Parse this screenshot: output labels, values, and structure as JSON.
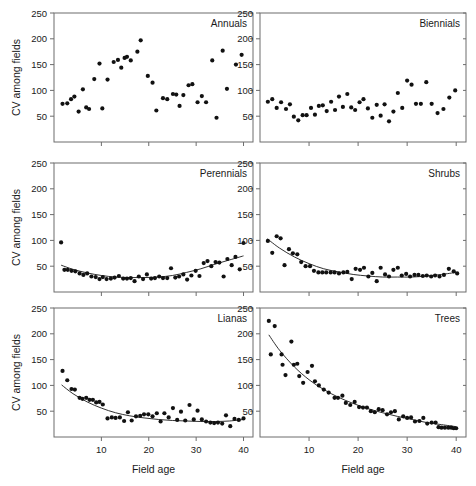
{
  "figure": {
    "axis_labels": {
      "y": "CV among fields",
      "x": "Field age"
    },
    "y_ticks": [
      "250",
      "200",
      "150",
      "100",
      "50"
    ],
    "y_tick_values": [
      250,
      200,
      150,
      100,
      50
    ],
    "x_ticks": [
      "10",
      "20",
      "30",
      "40"
    ],
    "x_tick_values": [
      10,
      20,
      30,
      40
    ],
    "ylim": [
      0,
      250
    ],
    "xlim": [
      0,
      42
    ],
    "marker_color": "#111111",
    "curve_color": "#1a1a1a",
    "axis_color": "#6d6d6d"
  },
  "chart_data": [
    {
      "type": "scatter",
      "title": "Annuals",
      "xlabel": "Field age",
      "ylabel": "CV among fields",
      "xlim": [
        0,
        42
      ],
      "ylim": [
        0,
        250
      ],
      "grid": false,
      "legend": "none",
      "has_fit_curve": false,
      "points": [
        [
          1.8,
          74
        ],
        [
          2.8,
          75
        ],
        [
          3.6,
          83
        ],
        [
          4.3,
          88
        ],
        [
          5.2,
          59
        ],
        [
          6.1,
          102
        ],
        [
          6.8,
          67
        ],
        [
          7.4,
          64
        ],
        [
          8.5,
          122
        ],
        [
          9.6,
          152
        ],
        [
          10.2,
          65
        ],
        [
          11.3,
          121
        ],
        [
          12.6,
          155
        ],
        [
          13.5,
          159
        ],
        [
          14.2,
          144
        ],
        [
          14.9,
          163
        ],
        [
          15.4,
          165
        ],
        [
          16.2,
          158
        ],
        [
          17.6,
          175
        ],
        [
          18.3,
          197
        ],
        [
          19.8,
          128
        ],
        [
          20.8,
          115
        ],
        [
          21.6,
          61
        ],
        [
          23.0,
          85
        ],
        [
          23.9,
          83
        ],
        [
          25.1,
          93
        ],
        [
          25.8,
          92
        ],
        [
          26.5,
          70
        ],
        [
          27.3,
          91
        ],
        [
          28.4,
          110
        ],
        [
          29.2,
          112
        ],
        [
          30.3,
          77
        ],
        [
          31.2,
          89
        ],
        [
          32.1,
          77
        ],
        [
          33.4,
          158
        ],
        [
          34.3,
          47
        ],
        [
          35.6,
          177
        ],
        [
          36.5,
          103
        ],
        [
          38.4,
          150
        ],
        [
          39.6,
          169
        ]
      ]
    },
    {
      "type": "scatter",
      "title": "Biennials",
      "xlabel": "Field age",
      "ylabel": "CV among fields",
      "xlim": [
        0,
        42
      ],
      "ylim": [
        0,
        250
      ],
      "grid": false,
      "legend": "none",
      "has_fit_curve": false,
      "points": [
        [
          1.6,
          78
        ],
        [
          2.5,
          83
        ],
        [
          3.4,
          66
        ],
        [
          4.3,
          77
        ],
        [
          5.3,
          64
        ],
        [
          6.1,
          73
        ],
        [
          6.9,
          49
        ],
        [
          7.8,
          42
        ],
        [
          8.7,
          52
        ],
        [
          9.5,
          52
        ],
        [
          10.4,
          66
        ],
        [
          11.2,
          53
        ],
        [
          12.0,
          70
        ],
        [
          12.8,
          71
        ],
        [
          13.6,
          60
        ],
        [
          14.5,
          78
        ],
        [
          15.3,
          62
        ],
        [
          16.1,
          88
        ],
        [
          16.9,
          68
        ],
        [
          17.8,
          93
        ],
        [
          18.6,
          67
        ],
        [
          19.4,
          62
        ],
        [
          20.3,
          77
        ],
        [
          21.1,
          83
        ],
        [
          22.0,
          65
        ],
        [
          22.9,
          47
        ],
        [
          23.8,
          72
        ],
        [
          24.6,
          51
        ],
        [
          25.4,
          73
        ],
        [
          26.3,
          40
        ],
        [
          27.2,
          59
        ],
        [
          28.1,
          95
        ],
        [
          29.0,
          66
        ],
        [
          30.0,
          119
        ],
        [
          30.9,
          111
        ],
        [
          31.8,
          74
        ],
        [
          32.8,
          74
        ],
        [
          33.9,
          116
        ],
        [
          35.0,
          74
        ],
        [
          36.2,
          56
        ],
        [
          37.4,
          64
        ],
        [
          38.6,
          86
        ],
        [
          39.8,
          100
        ]
      ]
    },
    {
      "type": "scatter",
      "title": "Perennials",
      "xlabel": "Field age",
      "ylabel": "CV among fields",
      "xlim": [
        0,
        42
      ],
      "ylim": [
        0,
        250
      ],
      "grid": false,
      "legend": "none",
      "has_fit_curve": true,
      "fit_curve_shape": "u-shaped-quadratic",
      "fit_curve": [
        [
          1.5,
          52
        ],
        [
          4,
          44
        ],
        [
          7,
          37
        ],
        [
          10,
          32
        ],
        [
          13,
          29
        ],
        [
          16,
          28
        ],
        [
          19,
          28
        ],
        [
          22,
          29
        ],
        [
          25,
          32
        ],
        [
          28,
          38
        ],
        [
          31,
          45
        ],
        [
          34,
          54
        ],
        [
          37,
          62
        ],
        [
          40,
          70
        ]
      ],
      "points": [
        [
          1.5,
          96
        ],
        [
          2.2,
          43
        ],
        [
          2.9,
          43
        ],
        [
          3.7,
          41
        ],
        [
          4.5,
          40
        ],
        [
          5.4,
          36
        ],
        [
          6.2,
          33
        ],
        [
          7.0,
          36
        ],
        [
          7.9,
          30
        ],
        [
          8.8,
          29
        ],
        [
          9.6,
          25
        ],
        [
          10.3,
          29
        ],
        [
          11.1,
          25
        ],
        [
          12.0,
          26
        ],
        [
          12.8,
          28
        ],
        [
          13.7,
          31
        ],
        [
          14.6,
          26
        ],
        [
          15.4,
          26
        ],
        [
          16.2,
          27
        ],
        [
          17.0,
          21
        ],
        [
          17.9,
          30
        ],
        [
          18.8,
          25
        ],
        [
          19.6,
          34
        ],
        [
          20.5,
          26
        ],
        [
          21.3,
          27
        ],
        [
          22.2,
          30
        ],
        [
          23.0,
          27
        ],
        [
          23.9,
          27
        ],
        [
          24.7,
          46
        ],
        [
          25.6,
          28
        ],
        [
          26.4,
          30
        ],
        [
          27.3,
          34
        ],
        [
          28.1,
          24
        ],
        [
          29.0,
          32
        ],
        [
          29.9,
          41
        ],
        [
          30.7,
          31
        ],
        [
          31.6,
          56
        ],
        [
          32.4,
          60
        ],
        [
          33.2,
          50
        ],
        [
          34.1,
          58
        ],
        [
          34.9,
          57
        ],
        [
          35.8,
          30
        ],
        [
          36.6,
          64
        ],
        [
          37.5,
          52
        ],
        [
          38.3,
          68
        ],
        [
          39.2,
          44
        ],
        [
          40.0,
          95
        ]
      ]
    },
    {
      "type": "scatter",
      "title": "Shrubs",
      "xlabel": "Field age",
      "ylabel": "CV among fields",
      "xlim": [
        0,
        42
      ],
      "ylim": [
        0,
        250
      ],
      "grid": false,
      "legend": "none",
      "has_fit_curve": true,
      "fit_curve_shape": "decaying-then-flat",
      "fit_curve": [
        [
          1.5,
          103
        ],
        [
          4,
          85
        ],
        [
          7,
          68
        ],
        [
          10,
          55
        ],
        [
          13,
          45
        ],
        [
          16,
          39
        ],
        [
          19,
          34
        ],
        [
          22,
          31
        ],
        [
          25,
          29
        ],
        [
          28,
          29
        ],
        [
          31,
          29
        ],
        [
          34,
          31
        ],
        [
          37,
          34
        ],
        [
          40,
          38
        ]
      ],
      "points": [
        [
          1.6,
          99
        ],
        [
          2.5,
          76
        ],
        [
          3.4,
          108
        ],
        [
          4.2,
          104
        ],
        [
          5.0,
          52
        ],
        [
          5.9,
          83
        ],
        [
          6.7,
          75
        ],
        [
          7.6,
          73
        ],
        [
          8.4,
          58
        ],
        [
          9.3,
          50
        ],
        [
          10.2,
          50
        ],
        [
          11.0,
          41
        ],
        [
          11.9,
          38
        ],
        [
          12.7,
          38
        ],
        [
          13.5,
          38
        ],
        [
          14.4,
          38
        ],
        [
          15.2,
          38
        ],
        [
          16.1,
          36
        ],
        [
          17.0,
          38
        ],
        [
          17.8,
          39
        ],
        [
          18.7,
          25
        ],
        [
          19.5,
          45
        ],
        [
          20.4,
          43
        ],
        [
          21.2,
          47
        ],
        [
          22.1,
          30
        ],
        [
          22.9,
          37
        ],
        [
          23.8,
          21
        ],
        [
          24.6,
          47
        ],
        [
          25.5,
          34
        ],
        [
          26.3,
          30
        ],
        [
          27.2,
          43
        ],
        [
          28.1,
          47
        ],
        [
          28.9,
          32
        ],
        [
          29.8,
          35
        ],
        [
          30.6,
          30
        ],
        [
          31.5,
          33
        ],
        [
          32.3,
          33
        ],
        [
          33.2,
          31
        ],
        [
          34.0,
          32
        ],
        [
          34.9,
          30
        ],
        [
          35.7,
          32
        ],
        [
          36.6,
          30
        ],
        [
          37.5,
          33
        ],
        [
          38.5,
          45
        ],
        [
          39.5,
          40
        ],
        [
          40.2,
          36
        ]
      ]
    },
    {
      "type": "scatter",
      "title": "Lianas",
      "xlabel": "Field age",
      "ylabel": "CV among fields",
      "xlim": [
        0,
        42
      ],
      "ylim": [
        0,
        250
      ],
      "grid": false,
      "legend": "none",
      "has_fit_curve": true,
      "fit_curve_shape": "decaying-then-flat",
      "fit_curve": [
        [
          1.6,
          101
        ],
        [
          4,
          84
        ],
        [
          7,
          68
        ],
        [
          10,
          56
        ],
        [
          13,
          47
        ],
        [
          16,
          41
        ],
        [
          19,
          37
        ],
        [
          22,
          34
        ],
        [
          25,
          32
        ],
        [
          28,
          31
        ],
        [
          31,
          30
        ],
        [
          34,
          30
        ],
        [
          37,
          31
        ],
        [
          40,
          34
        ]
      ],
      "points": [
        [
          1.8,
          128
        ],
        [
          2.8,
          110
        ],
        [
          3.7,
          93
        ],
        [
          4.4,
          92
        ],
        [
          5.4,
          76
        ],
        [
          6.0,
          74
        ],
        [
          6.8,
          76
        ],
        [
          7.5,
          72
        ],
        [
          8.2,
          72
        ],
        [
          8.9,
          67
        ],
        [
          9.6,
          68
        ],
        [
          10.3,
          63
        ],
        [
          11.3,
          36
        ],
        [
          12.2,
          38
        ],
        [
          13.0,
          37
        ],
        [
          13.9,
          38
        ],
        [
          14.8,
          31
        ],
        [
          15.6,
          48
        ],
        [
          16.4,
          32
        ],
        [
          17.3,
          40
        ],
        [
          18.2,
          41
        ],
        [
          19.0,
          44
        ],
        [
          19.9,
          44
        ],
        [
          20.8,
          40
        ],
        [
          21.7,
          46
        ],
        [
          22.5,
          30
        ],
        [
          23.3,
          46
        ],
        [
          24.2,
          38
        ],
        [
          25.1,
          56
        ],
        [
          26.0,
          33
        ],
        [
          26.8,
          49
        ],
        [
          27.7,
          32
        ],
        [
          28.6,
          62
        ],
        [
          29.5,
          34
        ],
        [
          30.3,
          51
        ],
        [
          31.2,
          34
        ],
        [
          32.1,
          30
        ],
        [
          33.0,
          28
        ],
        [
          33.8,
          27
        ],
        [
          34.6,
          28
        ],
        [
          35.5,
          26
        ],
        [
          36.3,
          42
        ],
        [
          37.2,
          21
        ],
        [
          38.1,
          35
        ],
        [
          39.0,
          33
        ],
        [
          40.0,
          36
        ]
      ]
    },
    {
      "type": "scatter",
      "title": "Trees",
      "xlabel": "Field age",
      "ylabel": "CV among fields",
      "xlim": [
        0,
        42
      ],
      "ylim": [
        0,
        250
      ],
      "grid": false,
      "legend": "none",
      "has_fit_curve": true,
      "fit_curve_shape": "exponential-decay",
      "fit_curve": [
        [
          1.8,
          198
        ],
        [
          4,
          168
        ],
        [
          7,
          136
        ],
        [
          10,
          111
        ],
        [
          13,
          92
        ],
        [
          16,
          77
        ],
        [
          19,
          65
        ],
        [
          22,
          55
        ],
        [
          25,
          47
        ],
        [
          28,
          40
        ],
        [
          31,
          34
        ],
        [
          34,
          28
        ],
        [
          37,
          24
        ],
        [
          40,
          20
        ]
      ],
      "points": [
        [
          1.8,
          225
        ],
        [
          2.2,
          160
        ],
        [
          3.0,
          215
        ],
        [
          4.4,
          160
        ],
        [
          4.6,
          140
        ],
        [
          5.2,
          120
        ],
        [
          6.4,
          185
        ],
        [
          6.9,
          140
        ],
        [
          7.6,
          142
        ],
        [
          8.0,
          118
        ],
        [
          8.8,
          105
        ],
        [
          9.7,
          126
        ],
        [
          10.6,
          138
        ],
        [
          11.2,
          108
        ],
        [
          12.0,
          100
        ],
        [
          13.0,
          92
        ],
        [
          14.0,
          86
        ],
        [
          15.2,
          76
        ],
        [
          15.9,
          76
        ],
        [
          16.8,
          80
        ],
        [
          17.5,
          66
        ],
        [
          18.4,
          62
        ],
        [
          19.3,
          68
        ],
        [
          20.2,
          58
        ],
        [
          21.0,
          57
        ],
        [
          21.8,
          57
        ],
        [
          22.6,
          50
        ],
        [
          23.4,
          48
        ],
        [
          24.2,
          54
        ],
        [
          25.0,
          52
        ],
        [
          25.9,
          44
        ],
        [
          26.7,
          48
        ],
        [
          27.5,
          50
        ],
        [
          28.3,
          34
        ],
        [
          29.2,
          40
        ],
        [
          30.0,
          37
        ],
        [
          30.8,
          38
        ],
        [
          31.6,
          30
        ],
        [
          32.5,
          31
        ],
        [
          33.3,
          37
        ],
        [
          34.1,
          26
        ],
        [
          35.0,
          28
        ],
        [
          35.8,
          28
        ],
        [
          36.4,
          19
        ],
        [
          37.0,
          18
        ],
        [
          37.7,
          18
        ],
        [
          38.4,
          18
        ],
        [
          39.0,
          18
        ],
        [
          39.5,
          17
        ],
        [
          40.0,
          17
        ]
      ]
    }
  ]
}
